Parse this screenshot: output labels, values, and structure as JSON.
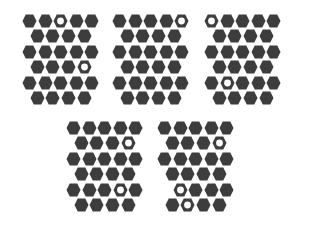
{
  "colors": {
    "fill": "#3d3d3d",
    "background": "#ffffff"
  },
  "layout": {
    "hex_w": 15,
    "hex_h": 14,
    "dx": 15.6,
    "dy": 15.4,
    "row_offset": 7.8
  },
  "grids": [
    {
      "x": 22,
      "y": 14,
      "rows": [
        [
          "f",
          "f",
          "e",
          "f",
          "f"
        ],
        [
          "f",
          "f",
          "f",
          "f"
        ],
        [
          "f",
          "f",
          "f",
          "f",
          "f"
        ],
        [
          "f",
          "f",
          "f",
          "e"
        ],
        [
          "f",
          "f",
          "f",
          "f",
          "f"
        ],
        [
          "f",
          "f",
          "f",
          "f"
        ]
      ]
    },
    {
      "x": 112,
      "y": 14,
      "rows": [
        [
          "f",
          "f",
          "f",
          "f",
          "e"
        ],
        [
          "f",
          "f",
          "f",
          "f"
        ],
        [
          "f",
          "f",
          "f",
          "f",
          "f"
        ],
        [
          "f",
          "f",
          "f",
          "f"
        ],
        [
          "f",
          "f",
          "f",
          "f",
          "f"
        ],
        [
          "f",
          "f",
          "f",
          "f"
        ]
      ]
    },
    {
      "x": 204,
      "y": 14,
      "rows": [
        [
          "e",
          "f",
          "f",
          "f",
          "f"
        ],
        [
          "f",
          "f",
          "f",
          "f"
        ],
        [
          "f",
          "f",
          "f",
          "f",
          "f"
        ],
        [
          "f",
          "f",
          "f",
          "f"
        ],
        [
          "f",
          "e",
          "f",
          "f",
          "f"
        ],
        [
          "f",
          "f",
          "f",
          "f"
        ]
      ]
    },
    {
      "x": 66,
      "y": 121,
      "rows": [
        [
          "f",
          "f",
          "f",
          "f",
          "f"
        ],
        [
          "f",
          "f",
          "f",
          "e"
        ],
        [
          "f",
          "f",
          "f",
          "f",
          "f"
        ],
        [
          "f",
          "f",
          "f",
          "f"
        ],
        [
          "f",
          "f",
          "f",
          "e",
          "f"
        ],
        [
          "f",
          "f",
          "f",
          "f"
        ]
      ]
    },
    {
      "x": 157,
      "y": 121,
      "rows": [
        [
          "f",
          "f",
          "f",
          "f",
          "f"
        ],
        [
          "f",
          "f",
          "f",
          "e"
        ],
        [
          "f",
          "f",
          "f",
          "f",
          "f"
        ],
        [
          "f",
          "f",
          "f",
          "f"
        ],
        [
          "n",
          "e",
          "f",
          "f",
          "f"
        ],
        [
          "f",
          "e",
          "f",
          "f"
        ]
      ]
    }
  ]
}
